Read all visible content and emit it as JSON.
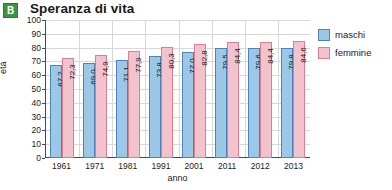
{
  "badge": {
    "letter": "B"
  },
  "chart_data": {
    "type": "bar",
    "title": "Speranza di vita",
    "xlabel": "anno",
    "ylabel": "età",
    "ylim": [
      0,
      100
    ],
    "yticks": [
      100,
      90,
      80,
      70,
      60,
      50,
      40,
      30,
      20,
      10,
      0
    ],
    "grid": true,
    "legend_position": "right",
    "categories": [
      "1961",
      "1971",
      "1981",
      "1991",
      "2001",
      "2011",
      "2012",
      "2013"
    ],
    "series": [
      {
        "name": "maschi",
        "color": "#9cc8e8",
        "values": [
          67.2,
          69.0,
          71.1,
          73.8,
          77.0,
          79.5,
          79.6,
          79.8
        ],
        "labels": [
          "67,2",
          "69,0",
          "71,1",
          "73,8",
          "77,0",
          "79,5",
          "79,6",
          "79,8"
        ]
      },
      {
        "name": "femmine",
        "color": "#f2c3cd",
        "values": [
          72.3,
          74.9,
          77.9,
          80.3,
          82.8,
          84.4,
          84.4,
          84.6
        ],
        "labels": [
          "72,3",
          "74,9",
          "77,9",
          "80,3",
          "82,8",
          "84,4",
          "84,4",
          "84,6"
        ]
      }
    ]
  }
}
